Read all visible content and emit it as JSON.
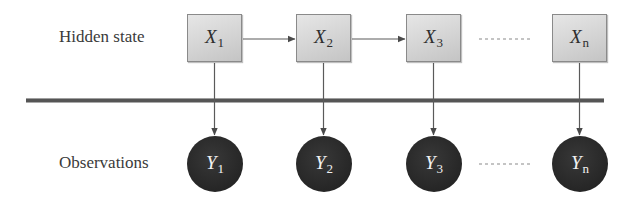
{
  "diagram": {
    "row_labels": {
      "hidden": "Hidden state",
      "observed": "Observations"
    },
    "hidden_states": [
      {
        "var": "X",
        "sub": "1"
      },
      {
        "var": "X",
        "sub": "2"
      },
      {
        "var": "X",
        "sub": "3"
      },
      {
        "var": "X",
        "sub": "n"
      }
    ],
    "observations": [
      {
        "var": "Y",
        "sub": "1"
      },
      {
        "var": "Y",
        "sub": "2"
      },
      {
        "var": "Y",
        "sub": "3"
      },
      {
        "var": "Y",
        "sub": "n"
      }
    ],
    "edges": [
      {
        "from": "X1",
        "to": "X2",
        "type": "arrow"
      },
      {
        "from": "X2",
        "to": "X3",
        "type": "arrow"
      },
      {
        "from": "X3",
        "to": "Xn",
        "type": "dashed-ellipsis"
      },
      {
        "from": "X1",
        "to": "Y1",
        "type": "arrow"
      },
      {
        "from": "X2",
        "to": "Y2",
        "type": "arrow"
      },
      {
        "from": "X3",
        "to": "Y3",
        "type": "arrow"
      },
      {
        "from": "Xn",
        "to": "Yn",
        "type": "arrow"
      },
      {
        "from": "Y3",
        "to": "Yn",
        "type": "dashed-ellipsis"
      }
    ],
    "colors": {
      "state_fill": "#d2d2d2",
      "state_border": "#8a8a8a",
      "observation_fill": "#262626",
      "observation_text": "#f2f2f2",
      "separator": "#555555",
      "arrow": "#555555"
    }
  }
}
